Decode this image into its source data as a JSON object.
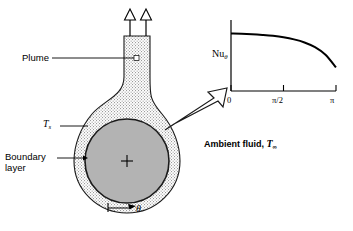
{
  "figure": {
    "background_color": "#ffffff",
    "line_color": "#000000",
    "sphere_fill": "#b3b3b3",
    "boundary_layer_fill": "#d9d9d9"
  },
  "labels": {
    "plume": "Plume",
    "surface_temperature": "T",
    "surface_temperature_sub": "s",
    "boundary_layer_line1": "Boundary",
    "boundary_layer_line2": "layer",
    "theta_body": "θ",
    "ambient_prefix": "Ambient fluid, ",
    "ambient_symbol": "T",
    "ambient_sub": "∞"
  },
  "chart_data": {
    "type": "line",
    "title": "",
    "xlabel": "",
    "ylabel": "Nu",
    "ylabel_sub": "θ",
    "x": [
      0,
      0.1,
      0.2,
      0.3,
      0.4,
      0.5,
      0.6,
      0.7,
      0.8,
      0.9,
      1.0
    ],
    "x_fraction_of_pi": [
      0,
      0.1,
      0.2,
      0.3,
      0.4,
      0.5,
      0.6,
      0.7,
      0.8,
      0.9,
      1.0
    ],
    "values": [
      1.0,
      0.995,
      0.985,
      0.97,
      0.95,
      0.92,
      0.875,
      0.81,
      0.71,
      0.55,
      0.28
    ],
    "xticks": [
      0,
      1.5708,
      3.1416
    ],
    "xticklabels": [
      "0",
      "π/2",
      "π"
    ],
    "yticks": [],
    "yticklabels": [],
    "xlim": [
      0,
      3.1416
    ],
    "ylim": [
      0,
      1.15
    ],
    "grid": false,
    "legend": false,
    "series": [
      {
        "name": "Nu_theta",
        "values": [
          1.0,
          0.995,
          0.985,
          0.97,
          0.95,
          0.92,
          0.875,
          0.81,
          0.71,
          0.55,
          0.28
        ]
      }
    ]
  },
  "icons": {
    "plume_arrow_left": "up-arrow-icon",
    "plume_arrow_right": "up-arrow-icon",
    "center_marker": "plus-marker-icon",
    "callout_arrow": "block-arrow-icon",
    "theta_arrow": "theta-direction-arrow-icon"
  }
}
